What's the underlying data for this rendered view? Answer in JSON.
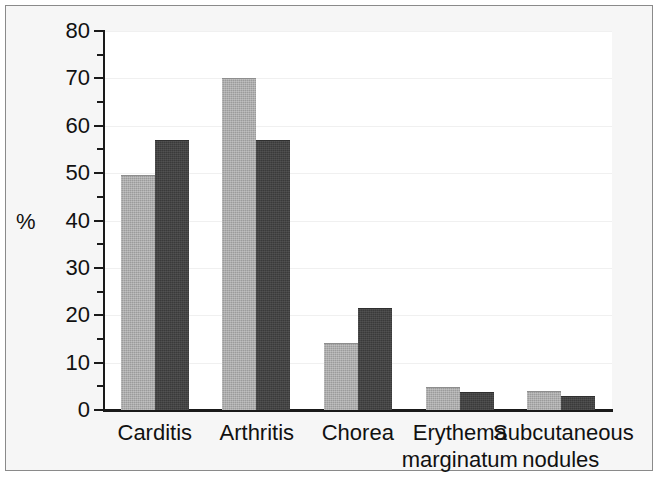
{
  "chart_data": {
    "type": "bar",
    "title": "",
    "subtitle": "",
    "xlabel": "",
    "ylabel": "%",
    "ylim": [
      0,
      80
    ],
    "ytick_step": 10,
    "yminor_step": 5,
    "grid": true,
    "grid_axis": "y",
    "legend": "none",
    "categories": [
      "Carditis",
      "Arthritis",
      "Chorea",
      "Erythema\nmarginatum",
      "Subcutaneous\nnodules"
    ],
    "ytick_labels": [
      "0",
      "10",
      "20",
      "30",
      "40",
      "50",
      "60",
      "70",
      "80"
    ],
    "ytick_values": [
      0,
      10,
      20,
      30,
      40,
      50,
      60,
      70,
      80
    ],
    "series": [
      {
        "name": "series-1",
        "color": "#9b9b9b",
        "values": [
          49.5,
          70,
          14.2,
          4.8,
          4.1
        ]
      },
      {
        "name": "series-2",
        "color": "#3a3a3a",
        "values": [
          57,
          57,
          21.5,
          3.7,
          3.0
        ]
      }
    ],
    "colors": {
      "series_1": "#9b9b9b",
      "series_2": "#3a3a3a",
      "axis": "#1a1a1a",
      "plot_background": "#ffffff",
      "figure_background": "#f6f6f6",
      "grid": "#f0f0f0",
      "border": "#8a8a8a"
    }
  }
}
